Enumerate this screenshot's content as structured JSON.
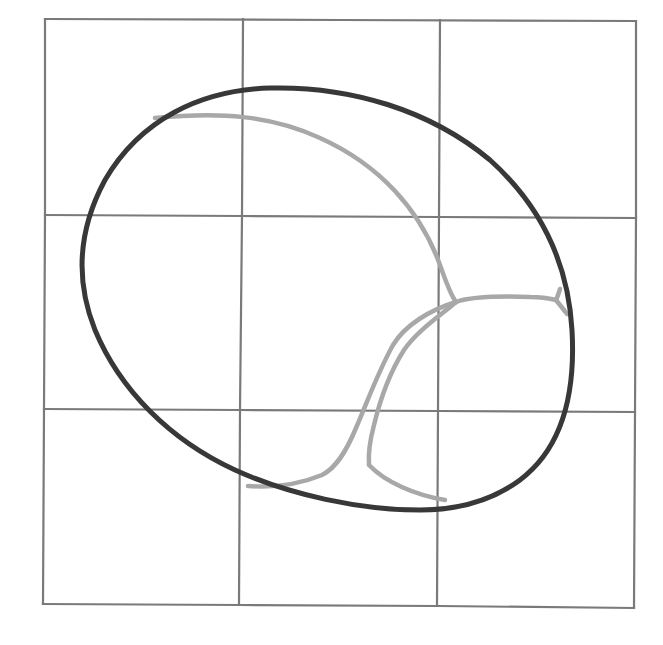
{
  "diagram": {
    "canvas": {
      "width": 663,
      "height": 645
    },
    "colors": {
      "background": "#ffffff",
      "grid": "#7a7a7a",
      "outline": "#383838",
      "veins": "#a8a8a8"
    },
    "stroke_widths": {
      "grid": 2.2,
      "outline": 5,
      "veins": 4.5
    },
    "grid": {
      "rows": 3,
      "cols": 3,
      "lines": [
        {
          "name": "grid-top-border",
          "d": "M45,19 L340,20 L636,21"
        },
        {
          "name": "grid-row-line-1",
          "d": "M45,215 L242,216 L439,217 L636,218"
        },
        {
          "name": "grid-row-line-2",
          "d": "M44,409 L240,410 L438,411 L635,412"
        },
        {
          "name": "grid-bottom-border",
          "d": "M43,604 L240,605 L438,606 L634,608"
        },
        {
          "name": "grid-left-border",
          "d": "M45,19 L45,215 L44,409 L43,604"
        },
        {
          "name": "grid-col-line-1",
          "d": "M243,19 L242,216 L240,410 L239,605"
        },
        {
          "name": "grid-col-line-2",
          "d": "M440,20 L439,217 L438,411 L437,606"
        },
        {
          "name": "grid-right-border",
          "d": "M636,21 L636,218 L635,412 L634,608"
        }
      ]
    },
    "outline": {
      "name": "egg-outline",
      "d": "M270,88 C350,86 430,110 490,160 C540,205 568,260 572,330 C576,400 560,450 520,480 C490,502 455,510 420,510 C360,510 290,495 235,470 C170,440 120,390 95,330 C75,280 78,230 105,180 C140,120 200,90 270,88 Z"
    },
    "veins": [
      {
        "name": "vein-upper-arc",
        "d": "M155,118 C220,112 270,115 320,138 C380,165 420,210 440,265 C446,282 450,294 456,302"
      },
      {
        "name": "vein-right-branch",
        "d": "M456,302 C470,297 500,296 530,297 C540,297 548,298 556,300"
      },
      {
        "name": "vein-right-fork-up",
        "d": "M556,300 C558,296 559,292 560,289"
      },
      {
        "name": "vein-right-fork-down",
        "d": "M556,300 C560,305 564,310 567,314"
      },
      {
        "name": "vein-outer-sweep",
        "d": "M456,302 C430,310 405,325 393,345 C378,372 368,400 356,428 C346,452 336,468 322,475 C300,484 275,488 248,486"
      },
      {
        "name": "vein-inner-sweep",
        "d": "M456,302 C440,316 418,330 404,350 C390,372 380,400 374,425 C370,440 368,452 369,465 C385,482 415,495 445,500"
      }
    ]
  }
}
